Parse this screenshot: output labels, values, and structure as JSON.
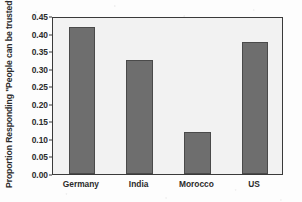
{
  "chart_data": {
    "type": "bar",
    "title": "",
    "subtitle": "",
    "xlabel": "",
    "ylabel": "Proportion Responding \"People can be trusted\"",
    "categories": [
      "Germany",
      "India",
      "Morocco",
      "US"
    ],
    "values": [
      0.42,
      0.325,
      0.12,
      0.375
    ],
    "series": [
      {
        "name": "Proportion Responding \"People can be trusted\"",
        "values": [
          0.42,
          0.325,
          0.12,
          0.375
        ]
      }
    ],
    "ylim": [
      0.0,
      0.45
    ],
    "ytick_values": [
      0.0,
      0.05,
      0.1,
      0.15,
      0.2,
      0.25,
      0.3,
      0.35,
      0.4,
      0.45
    ],
    "ytick_labels": [
      "0.00",
      "0.05",
      "0.10",
      "0.15",
      "0.20",
      "0.25",
      "0.30",
      "0.35",
      "0.40",
      "0.45"
    ],
    "grid": false,
    "legend": false,
    "legend_position": "none",
    "bar_color": "#6e6e6e",
    "bar_edge_color": "#4a4a4a",
    "plot_background": "#f2f2f2",
    "axis_color": "#3a3a3a",
    "text_color": "#2b2b2b"
  }
}
